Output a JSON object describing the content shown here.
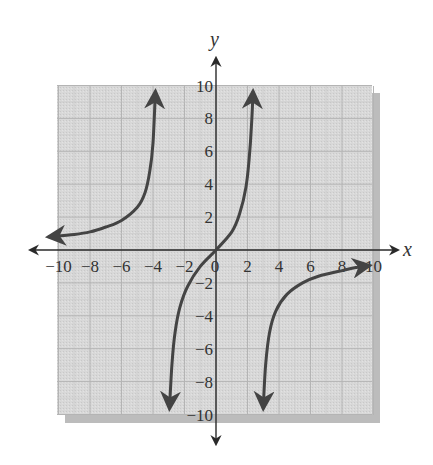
{
  "chart_data": {
    "type": "line",
    "title": "",
    "xlabel": "x",
    "ylabel": "y",
    "xlim": [
      -10,
      10
    ],
    "ylim": [
      -10,
      10
    ],
    "grid": true,
    "legend": null,
    "x_ticks": [
      -10,
      -8,
      -6,
      -4,
      -2,
      0,
      2,
      4,
      6,
      8,
      10
    ],
    "y_ticks": [
      -10,
      -8,
      -6,
      -4,
      -2,
      2,
      4,
      6,
      8,
      10
    ],
    "x_tick_labels": [
      "−10",
      "−8",
      "−6",
      "−4",
      "−2",
      "0",
      "2",
      "4",
      "6",
      "8",
      "10"
    ],
    "y_tick_labels": [
      "−10",
      "−8",
      "−6",
      "−4",
      "−2",
      "2",
      "4",
      "6",
      "8",
      "10"
    ],
    "vertical_asymptotes_approx": [
      -3.5,
      2.6
    ],
    "series": [
      {
        "name": "left-branch",
        "points": [
          [
            -10.6,
            0.8
          ],
          [
            -9,
            0.95
          ],
          [
            -8,
            1.1
          ],
          [
            -7,
            1.4
          ],
          [
            -6,
            1.8
          ],
          [
            -5,
            2.6
          ],
          [
            -4.5,
            3.5
          ],
          [
            -4.2,
            4.8
          ],
          [
            -4.0,
            6.5
          ],
          [
            -3.85,
            9.6
          ]
        ],
        "arrows": [
          "start",
          "end"
        ]
      },
      {
        "name": "middle-branch",
        "points": [
          [
            -2.95,
            -9.6
          ],
          [
            -2.8,
            -7
          ],
          [
            -2.6,
            -5
          ],
          [
            -2.3,
            -3.5
          ],
          [
            -1.8,
            -2.2
          ],
          [
            -1,
            -1
          ],
          [
            0,
            0
          ],
          [
            1,
            1.1
          ],
          [
            1.5,
            2.2
          ],
          [
            1.9,
            3.8
          ],
          [
            2.1,
            5.5
          ],
          [
            2.25,
            7.5
          ],
          [
            2.35,
            9.6
          ]
        ],
        "arrows": [
          "start",
          "end"
        ]
      },
      {
        "name": "right-branch",
        "points": [
          [
            3.0,
            -9.6
          ],
          [
            3.15,
            -7
          ],
          [
            3.4,
            -5
          ],
          [
            3.8,
            -3.7
          ],
          [
            4.5,
            -2.7
          ],
          [
            5.5,
            -2.0
          ],
          [
            6.5,
            -1.6
          ],
          [
            8,
            -1.25
          ],
          [
            9,
            -1.05
          ],
          [
            9.7,
            -0.95
          ]
        ],
        "arrows": [
          "start",
          "end"
        ]
      }
    ]
  },
  "colors": {
    "grid_bg": "#d6d6d6",
    "grid_line": "#b8b8b8",
    "shadow": "#bdbdbd",
    "axis": "#2a2a2a",
    "curve": "#444444"
  }
}
